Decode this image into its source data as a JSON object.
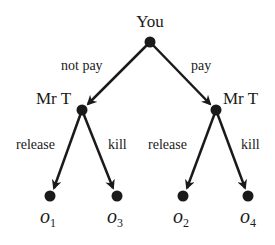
{
  "diagram": {
    "type": "game-tree",
    "root": {
      "player": "You"
    },
    "edges_from_root": [
      {
        "label": "not pay",
        "to": "Mr T (left)"
      },
      {
        "label": "pay",
        "to": "Mr T (right)"
      }
    ],
    "nodes": {
      "left": {
        "player": "Mr T",
        "edges": [
          {
            "label": "release",
            "outcome": "o1"
          },
          {
            "label": "kill",
            "outcome": "o3"
          }
        ]
      },
      "right": {
        "player": "Mr T",
        "edges": [
          {
            "label": "release",
            "outcome": "o2"
          },
          {
            "label": "kill",
            "outcome": "o4"
          }
        ]
      }
    },
    "labels": {
      "root_player": "You",
      "left_player": "Mr T",
      "right_player": "Mr T",
      "edge_not_pay": "not pay",
      "edge_pay": "pay",
      "edge_left_release": "release",
      "edge_left_kill": "kill",
      "edge_right_release": "release",
      "edge_right_kill": "kill"
    },
    "outcomes": [
      {
        "base": "o",
        "sub": "1"
      },
      {
        "base": "o",
        "sub": "3"
      },
      {
        "base": "o",
        "sub": "2"
      },
      {
        "base": "o",
        "sub": "4"
      }
    ],
    "colors": {
      "ink": "#1a1a1a",
      "background": "#ffffff"
    }
  }
}
